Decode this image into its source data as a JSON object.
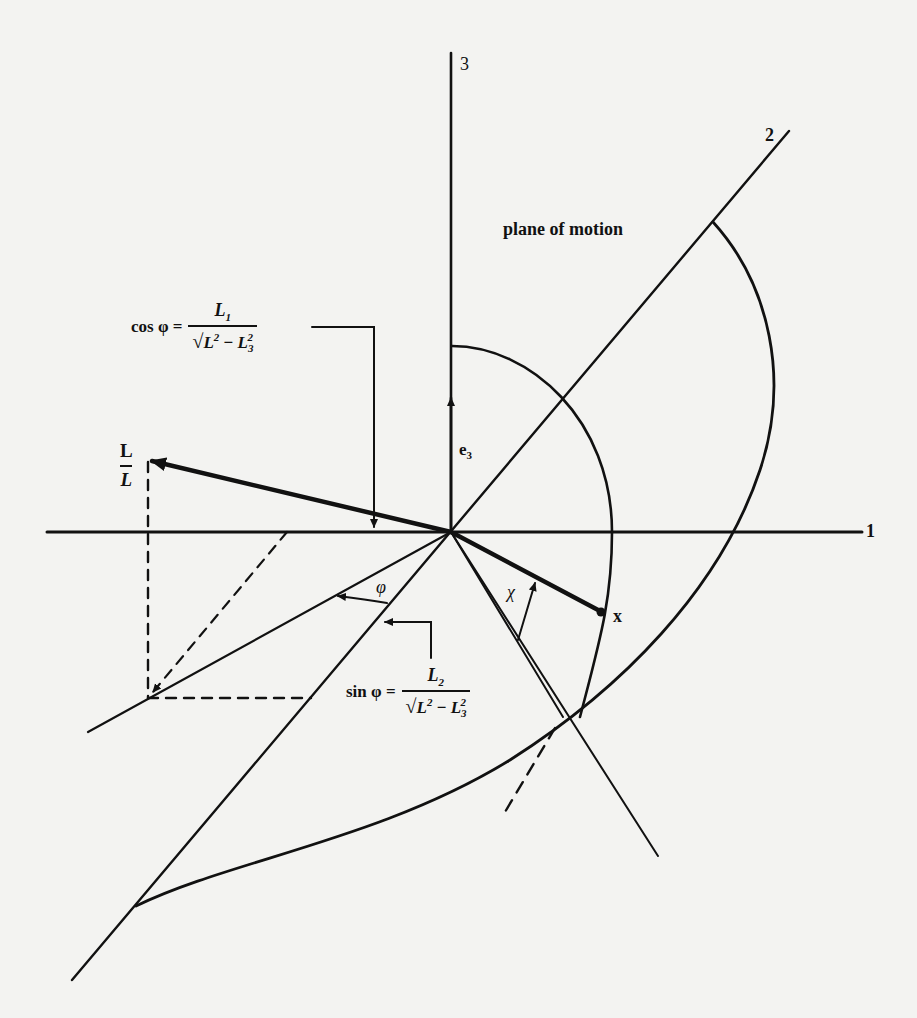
{
  "figure": {
    "axes": {
      "axis1_label": "1",
      "axis2_label": "2",
      "axis3_label": "3"
    },
    "labels": {
      "plane": "plane of motion",
      "e3": "e",
      "e3_sub": "3",
      "L_num": "L",
      "L_den": "L",
      "phi": "φ",
      "chi": "χ",
      "x": "x"
    },
    "formulas": {
      "cos": {
        "lhs": "cos φ =",
        "num": "L",
        "num_sub": "1",
        "den_sqrt": "√",
        "den_a": "L",
        "den_a_sup": "2",
        "den_op": " − ",
        "den_b": "L",
        "den_b_sub": "3",
        "den_b_sup": "2"
      },
      "sin": {
        "lhs": "sin φ =",
        "num": "L",
        "num_sub": "2",
        "den_sqrt": "√",
        "den_a": "L",
        "den_a_sup": "2",
        "den_op": " − ",
        "den_b": "L",
        "den_b_sub": "3",
        "den_b_sup": "2"
      }
    },
    "colors": {
      "ink": "#111111",
      "paper": "#f3f3f1"
    }
  }
}
